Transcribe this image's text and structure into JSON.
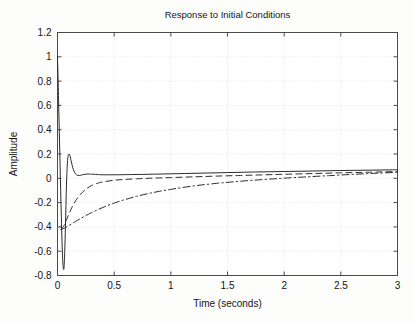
{
  "figure": {
    "title": "Response to Initial Conditions",
    "background_color": "#fdfdfc",
    "line_color": "#2a2a2a",
    "grid_color": "#d8d8d8",
    "axis_color": "#4a4a4a"
  },
  "axes": {
    "x_label": "Time (seconds)",
    "y_label": "Amplitude",
    "x_ticks": [
      "0",
      "0.5",
      "1",
      "1.5",
      "2",
      "2.5",
      "3"
    ],
    "y_ticks": [
      "1.2",
      "1",
      "0.8",
      "0.6",
      "0.4",
      "0.2",
      "0",
      "-0.2",
      "-0.4",
      "-0.6",
      "-0.8"
    ]
  },
  "chart_data": {
    "type": "line",
    "title": "Response to Initial Conditions",
    "xlabel": "Time (seconds)",
    "ylabel": "Amplitude",
    "xlim": [
      0,
      3
    ],
    "ylim": [
      -0.8,
      1.2
    ],
    "xticks": [
      0,
      0.5,
      1,
      1.5,
      2,
      2.5,
      3
    ],
    "yticks": [
      -0.8,
      -0.6,
      -0.4,
      -0.2,
      0,
      0.2,
      0.4,
      0.6,
      0.8,
      1.0,
      1.2
    ],
    "grid": true,
    "legend": null,
    "series": [
      {
        "name": "state-1",
        "style": "solid",
        "x": [
          0,
          0.004,
          0.01,
          0.016,
          0.022,
          0.028,
          0.034,
          0.04,
          0.046,
          0.052,
          0.058,
          0.064,
          0.07,
          0.076,
          0.082,
          0.09,
          0.1,
          0.11,
          0.12,
          0.13,
          0.14,
          0.15,
          0.16,
          0.17,
          0.18,
          0.19,
          0.2,
          0.22,
          0.24,
          0.26,
          0.28,
          0.3,
          0.35,
          0.4,
          0.5,
          0.6,
          0.8,
          1.0,
          1.25,
          1.5,
          1.75,
          2.0,
          2.25,
          2.5,
          2.75,
          3.0
        ],
        "y": [
          1.0,
          0.86,
          0.62,
          0.38,
          0.14,
          -0.1,
          -0.32,
          -0.52,
          -0.67,
          -0.745,
          -0.73,
          -0.6,
          -0.4,
          -0.17,
          0.02,
          0.16,
          0.2,
          0.185,
          0.145,
          0.105,
          0.072,
          0.05,
          0.035,
          0.028,
          0.024,
          0.023,
          0.024,
          0.029,
          0.033,
          0.035,
          0.035,
          0.034,
          0.031,
          0.029,
          0.029,
          0.03,
          0.033,
          0.037,
          0.042,
          0.047,
          0.052,
          0.056,
          0.06,
          0.064,
          0.067,
          0.07
        ]
      },
      {
        "name": "state-2",
        "style": "dashed",
        "x": [
          0.028,
          0.04,
          0.05,
          0.06,
          0.08,
          0.1,
          0.13,
          0.16,
          0.2,
          0.25,
          0.3,
          0.35,
          0.4,
          0.5,
          0.6,
          0.7,
          0.8,
          0.9,
          1.0,
          1.2,
          1.4,
          1.6,
          1.8,
          2.0,
          2.25,
          2.5,
          2.75,
          3.0
        ],
        "y": [
          -0.4,
          -0.41,
          -0.4,
          -0.385,
          -0.34,
          -0.295,
          -0.235,
          -0.185,
          -0.135,
          -0.09,
          -0.06,
          -0.042,
          -0.03,
          -0.016,
          -0.009,
          -0.004,
          0.0,
          0.003,
          0.006,
          0.012,
          0.018,
          0.023,
          0.028,
          0.033,
          0.039,
          0.045,
          0.05,
          0.055
        ]
      },
      {
        "name": "state-3",
        "style": "dashdot",
        "x": [
          0.028,
          0.05,
          0.08,
          0.12,
          0.16,
          0.2,
          0.25,
          0.3,
          0.4,
          0.5,
          0.6,
          0.7,
          0.8,
          0.9,
          1.0,
          1.2,
          1.4,
          1.6,
          1.8,
          2.0,
          2.2,
          2.4,
          2.6,
          2.8,
          3.0
        ],
        "y": [
          -0.42,
          -0.415,
          -0.4,
          -0.378,
          -0.355,
          -0.333,
          -0.307,
          -0.283,
          -0.24,
          -0.204,
          -0.174,
          -0.148,
          -0.126,
          -0.107,
          -0.091,
          -0.063,
          -0.042,
          -0.025,
          -0.011,
          0.001,
          0.012,
          0.022,
          0.032,
          0.041,
          0.05
        ]
      }
    ]
  }
}
